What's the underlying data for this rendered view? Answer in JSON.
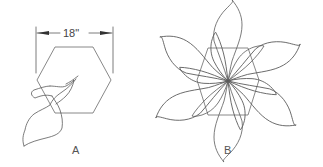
{
  "diagram": {
    "panel_a": {
      "label": "A",
      "dimension_label": "18\"",
      "description": "single petal overlapping hexagon"
    },
    "panel_b": {
      "label": "B",
      "description": "six petals arranged radially around hexagon center"
    },
    "colors": {
      "line": "#5a5a5a",
      "background": "#ffffff"
    }
  }
}
